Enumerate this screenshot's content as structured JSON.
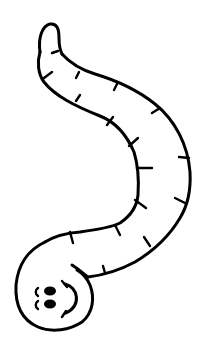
{
  "image": {
    "subject": "cartoon worm",
    "style": "black line-art coloring page",
    "background_color": "#ffffff",
    "line_color": "#000000"
  },
  "worm": {
    "segment_mark_count": 16,
    "face": {
      "eyes": 2,
      "expression": "smile"
    }
  }
}
